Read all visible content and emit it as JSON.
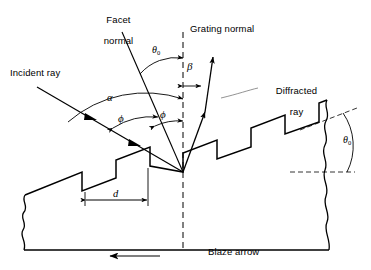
{
  "figure": {
    "background_color": "#ffffff",
    "line_color": "#000000",
    "width": 371,
    "height": 270
  },
  "labels": {
    "facet_normal_line1": "Facet",
    "facet_normal_line2": "normal",
    "grating_normal": "Grating normal",
    "incident_ray": "Incident ray",
    "diffracted_ray_line1": "Diffracted",
    "diffracted_ray_line2": "ray",
    "blaze_arrow": "Blaze arrow"
  },
  "symbols": {
    "theta0_top": "θ",
    "theta0_top_sub": "0",
    "theta0_right": "θ",
    "theta0_right_sub": "0",
    "beta": "β",
    "alpha": "α",
    "phi_left": "ϕ",
    "phi_right": "ϕ",
    "groove_spacing": "d"
  },
  "annotations": {
    "theta0_meaning": "blaze angle between facet normal and grating normal",
    "alpha_meaning": "incidence angle from grating normal",
    "beta_meaning": "diffraction angle from grating normal",
    "phi_meaning": "angle between ray and facet normal",
    "d_meaning": "groove spacing"
  },
  "geometry": {
    "vertex_x": 183,
    "vertex_y": 172,
    "grating_normal_style": "dashed-vertical",
    "facet_normal_style": "solid",
    "groove_count": 5,
    "blaze_arrow_direction": "left"
  }
}
